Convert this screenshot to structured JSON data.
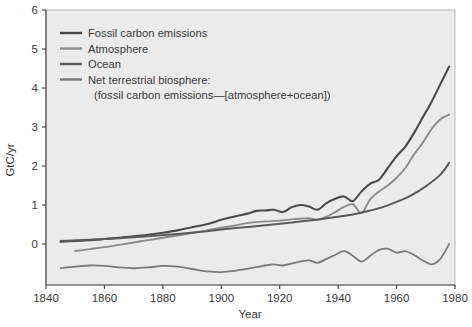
{
  "chart_data": {
    "type": "line",
    "title": "",
    "xlabel": "Year",
    "ylabel": "GtC/yr",
    "xlim": [
      1840,
      1980
    ],
    "ylim": [
      -1.05,
      6
    ],
    "xticks": [
      1840,
      1860,
      1880,
      1900,
      1920,
      1940,
      1960,
      1980
    ],
    "yticks": [
      0,
      1,
      2,
      3,
      4,
      5,
      6
    ],
    "xtick_labels": [
      "1840",
      "1860",
      "1880",
      "1900",
      "1920",
      "1940",
      "1960",
      "1980"
    ],
    "ytick_labels": [
      "0",
      "1",
      "2",
      "3",
      "4",
      "5",
      "6"
    ],
    "grid": false,
    "legend_position": "upper-left",
    "plot_bgcolor": "#ebebeb",
    "series": [
      {
        "name": "Fossil carbon emissions",
        "color": "#4a4a4a",
        "width": 2.1,
        "x": [
          1845,
          1850,
          1855,
          1860,
          1865,
          1870,
          1875,
          1880,
          1885,
          1890,
          1895,
          1900,
          1903,
          1906,
          1909,
          1912,
          1915,
          1918,
          1921,
          1924,
          1927,
          1930,
          1933,
          1936,
          1939,
          1942,
          1945,
          1948,
          1951,
          1954,
          1957,
          1960,
          1963,
          1966,
          1969,
          1972,
          1975,
          1978
        ],
        "y": [
          0.06,
          0.08,
          0.1,
          0.13,
          0.16,
          0.2,
          0.24,
          0.29,
          0.35,
          0.43,
          0.51,
          0.62,
          0.68,
          0.73,
          0.78,
          0.85,
          0.86,
          0.88,
          0.82,
          0.94,
          1.0,
          0.96,
          0.88,
          1.05,
          1.16,
          1.22,
          1.1,
          1.35,
          1.55,
          1.65,
          1.95,
          2.25,
          2.5,
          2.85,
          3.25,
          3.65,
          4.1,
          4.55
        ]
      },
      {
        "name": "Atmosphere",
        "color": "#8c8c8c",
        "width": 1.9,
        "x": [
          1850,
          1855,
          1860,
          1865,
          1870,
          1875,
          1880,
          1885,
          1890,
          1895,
          1900,
          1905,
          1910,
          1915,
          1920,
          1925,
          1930,
          1933,
          1936,
          1939,
          1942,
          1945,
          1948,
          1951,
          1954,
          1957,
          1960,
          1963,
          1966,
          1969,
          1972,
          1975,
          1978
        ],
        "y": [
          -0.18,
          -0.13,
          -0.08,
          -0.02,
          0.04,
          0.1,
          0.16,
          0.22,
          0.28,
          0.35,
          0.42,
          0.48,
          0.55,
          0.58,
          0.6,
          0.64,
          0.66,
          0.62,
          0.7,
          0.82,
          0.95,
          1.02,
          0.8,
          1.15,
          1.35,
          1.5,
          1.7,
          1.95,
          2.3,
          2.6,
          2.95,
          3.2,
          3.32
        ]
      },
      {
        "name": "Ocean",
        "color": "#5a5a5a",
        "width": 2.0,
        "x": [
          1845,
          1855,
          1865,
          1875,
          1885,
          1895,
          1905,
          1915,
          1925,
          1935,
          1945,
          1950,
          1955,
          1960,
          1965,
          1970,
          1975,
          1978
        ],
        "y": [
          0.08,
          0.11,
          0.15,
          0.2,
          0.26,
          0.33,
          0.41,
          0.48,
          0.56,
          0.65,
          0.76,
          0.84,
          0.94,
          1.08,
          1.25,
          1.48,
          1.78,
          2.08
        ]
      },
      {
        "name": "Net terrestrial biosphere",
        "color": "#7a7a7a",
        "width": 1.8,
        "x": [
          1845,
          1850,
          1855,
          1860,
          1865,
          1870,
          1875,
          1880,
          1885,
          1890,
          1895,
          1900,
          1905,
          1910,
          1915,
          1918,
          1921,
          1924,
          1927,
          1930,
          1933,
          1936,
          1939,
          1942,
          1945,
          1948,
          1951,
          1954,
          1957,
          1960,
          1963,
          1966,
          1969,
          1972,
          1975,
          1978
        ],
        "y": [
          -0.62,
          -0.58,
          -0.55,
          -0.56,
          -0.6,
          -0.62,
          -0.6,
          -0.56,
          -0.58,
          -0.64,
          -0.7,
          -0.72,
          -0.68,
          -0.62,
          -0.55,
          -0.52,
          -0.55,
          -0.5,
          -0.45,
          -0.42,
          -0.48,
          -0.38,
          -0.28,
          -0.18,
          -0.3,
          -0.45,
          -0.3,
          -0.15,
          -0.12,
          -0.22,
          -0.18,
          -0.28,
          -0.42,
          -0.52,
          -0.38,
          0.0
        ]
      }
    ]
  },
  "legend": {
    "items": [
      {
        "label": "Fossil carbon emissions",
        "color": "#4a4a4a"
      },
      {
        "label": "Atmosphere",
        "color": "#8c8c8c"
      },
      {
        "label": "Ocean",
        "color": "#5a5a5a"
      },
      {
        "label": "Net terrestrial biosphere:",
        "color": "#7a7a7a"
      }
    ],
    "sublabel": "(fossil carbon emissions—[atmosphere+ocean])"
  }
}
